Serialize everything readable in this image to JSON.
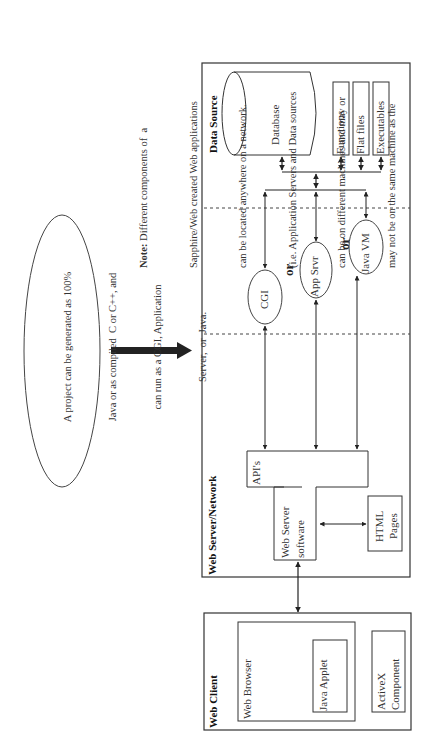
{
  "diagram": {
    "orientation": "rotated -90deg (text reads bottom to top)",
    "project_note": {
      "lines": [
        "A project can be generated as 100%",
        "Java or as compiled  C or C++, and",
        "can run as a CGI, Application",
        "Server,  or  Java."
      ]
    },
    "note": {
      "label": "Note:",
      "lines": [
        " Different components of  a",
        "Sapphire/Web created Web applications",
        "can be located anywhere on a network.",
        "(i.e. Application Servers and Data sources",
        "can be on different machines and may or",
        "may not be on the same machine as the"
      ]
    },
    "tiers": {
      "data_source": {
        "title": "Data Source",
        "database": "Database",
        "items": [
          "Functions",
          "Flat files",
          "Executables"
        ]
      },
      "middle": {
        "options": [
          "CGI",
          "App Srvr",
          "Java VM"
        ],
        "connectors": [
          "or",
          "or"
        ]
      },
      "web_server": {
        "title": "Web Server/Network",
        "apis": "API's",
        "software_line1": "Web Server",
        "software_line2": "software",
        "html_line1": "HTML",
        "html_line2": "Pages"
      },
      "web_client": {
        "title": "Web Client",
        "browser": "Web Browser",
        "applet": "Java Applet",
        "activex_line1": "ActiveX",
        "activex_line2": "Component"
      }
    },
    "colors": {
      "line": "#333333",
      "background": "#ffffff"
    }
  }
}
